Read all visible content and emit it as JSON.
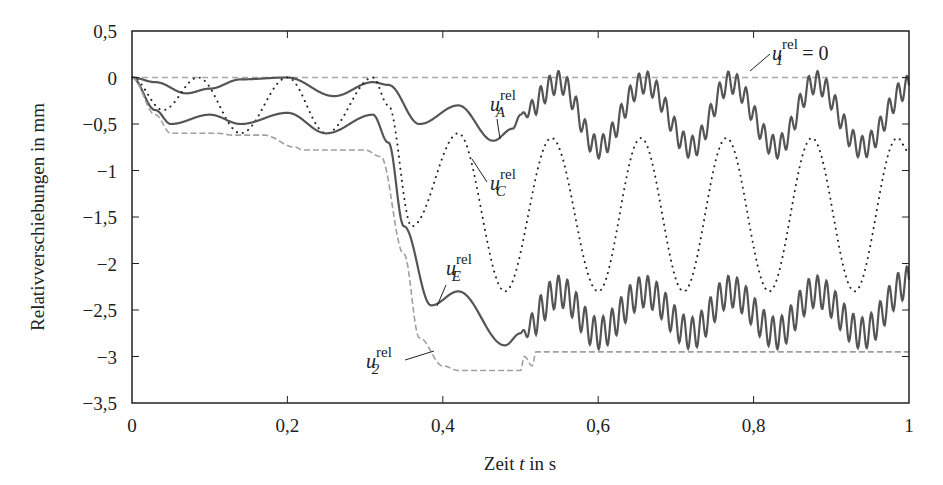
{
  "chart_data": {
    "type": "line",
    "title": "",
    "xlabel": "Zeit t in s",
    "xlabel_parts": {
      "pre": "Zeit ",
      "var": "t",
      "post": " in s"
    },
    "ylabel": "Relativverschiebungen in mm",
    "xlim": [
      0,
      1
    ],
    "ylim": [
      -3.5,
      0.5
    ],
    "xticks": [
      0,
      0.2,
      0.4,
      0.6,
      0.8,
      1
    ],
    "xtick_labels": [
      "0",
      "0,2",
      "0,4",
      "0,6",
      "0,8",
      "1"
    ],
    "yticks": [
      0.5,
      0,
      -0.5,
      -1,
      -1.5,
      -2,
      -2.5,
      -3,
      -3.5
    ],
    "ytick_labels": [
      "0,5",
      "0",
      "−0,5",
      "−1",
      "−1,5",
      "−2",
      "−2,5",
      "−3",
      "−3,5"
    ],
    "grid": false,
    "legend": "inline annotations",
    "series": [
      {
        "name": "u1_rel",
        "label": "u1^rel = 0",
        "style": "dashed-light",
        "color": "#a8a8a8",
        "x": [
          0,
          1
        ],
        "y": [
          0,
          0
        ]
      },
      {
        "name": "uA_rel",
        "label": "uA^rel",
        "style": "solid",
        "color": "#555555",
        "x": [
          0,
          0.03,
          0.07,
          0.1,
          0.14,
          0.2,
          0.26,
          0.31,
          0.33,
          0.37,
          0.42,
          0.465,
          0.49,
          0.5,
          0.55,
          0.6,
          0.66,
          0.72,
          0.77,
          0.83,
          0.88,
          0.94,
          1.0
        ],
        "y": [
          0,
          -0.05,
          -0.17,
          -0.12,
          -0.02,
          0,
          -0.2,
          -0.05,
          -0.08,
          -0.5,
          -0.3,
          -0.68,
          -0.55,
          -0.4,
          -0.05,
          -0.75,
          -0.05,
          -0.75,
          -0.05,
          -0.75,
          -0.05,
          -0.75,
          -0.1
        ],
        "hf_start": 0.5,
        "hf_amp": 0.12,
        "hf_period": 0.0115
      },
      {
        "name": "uC_rel",
        "label": "uC^rel",
        "style": "dotted",
        "color": "#222222",
        "x": [
          0,
          0.04,
          0.085,
          0.14,
          0.2,
          0.25,
          0.31,
          0.33,
          0.36,
          0.42,
          0.48,
          0.54,
          0.6,
          0.655,
          0.71,
          0.765,
          0.82,
          0.875,
          0.93,
          0.985,
          1.0
        ],
        "y": [
          0,
          -0.35,
          0,
          -0.6,
          0,
          -0.6,
          0,
          -0.3,
          -1.6,
          -0.6,
          -2.3,
          -0.65,
          -2.3,
          -0.65,
          -2.3,
          -0.65,
          -2.3,
          -0.65,
          -2.3,
          -0.65,
          -0.8
        ]
      },
      {
        "name": "uE_rel",
        "label": "uE^rel",
        "style": "solid",
        "color": "#555555",
        "x": [
          0,
          0.03,
          0.05,
          0.1,
          0.14,
          0.2,
          0.25,
          0.31,
          0.33,
          0.35,
          0.385,
          0.42,
          0.48,
          0.5,
          0.55,
          0.6,
          0.66,
          0.72,
          0.77,
          0.83,
          0.88,
          0.94,
          1.0
        ],
        "y": [
          0,
          -0.35,
          -0.5,
          -0.4,
          -0.5,
          -0.38,
          -0.6,
          -0.4,
          -0.7,
          -1.6,
          -2.45,
          -2.3,
          -2.88,
          -2.75,
          -2.3,
          -2.75,
          -2.3,
          -2.75,
          -2.3,
          -2.75,
          -2.3,
          -2.75,
          -2.2
        ],
        "hf_start": 0.5,
        "hf_amp": 0.17,
        "hf_period": 0.0115
      },
      {
        "name": "u2_rel",
        "label": "u2^rel",
        "style": "dashed",
        "color": "#a0a0a0",
        "x": [
          0,
          0.03,
          0.05,
          0.11,
          0.13,
          0.17,
          0.21,
          0.22,
          0.3,
          0.32,
          0.35,
          0.37,
          0.4,
          0.42,
          0.5,
          0.505,
          0.515,
          0.52,
          1.0
        ],
        "y": [
          0,
          -0.4,
          -0.6,
          -0.6,
          -0.62,
          -0.62,
          -0.75,
          -0.78,
          -0.78,
          -0.85,
          -1.9,
          -2.8,
          -3.1,
          -3.15,
          -3.15,
          -3.0,
          -3.1,
          -2.95,
          -2.95
        ]
      }
    ],
    "annotations": [
      {
        "text": "u",
        "sub": "1",
        "sup": "rel",
        "suffix": " = 0"
      },
      {
        "text": "u",
        "sub": "A",
        "sup": "rel",
        "suffix": ""
      },
      {
        "text": "u",
        "sub": "C",
        "sup": "rel",
        "suffix": ""
      },
      {
        "text": "u",
        "sub": "E",
        "sup": "rel",
        "suffix": ""
      },
      {
        "text": "u",
        "sub": "2",
        "sup": "rel",
        "suffix": ""
      }
    ]
  }
}
